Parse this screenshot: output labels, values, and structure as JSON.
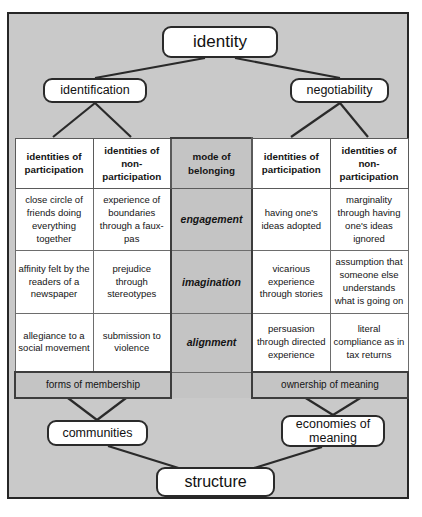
{
  "diagram": {
    "type": "hierarchy-matrix",
    "root_node": "identity",
    "left_branch": "identification",
    "right_branch": "negotiability",
    "left_band": "forms of membership",
    "right_band": "ownership of meaning",
    "left_outcome": "communities",
    "right_outcome": "economies of meaning",
    "bottom_node": "structure"
  },
  "nodes": {
    "identity": "identity",
    "identification": "identification",
    "negotiability": "negotiability",
    "communities": "communities",
    "economies_of_meaning": "economies of meaning",
    "structure": "structure"
  },
  "matrix": {
    "headers": [
      "identities of participation",
      "identities of non-participation",
      "mode of belonging",
      "identities of participation",
      "identities of non-participation"
    ],
    "rows": [
      {
        "mode": "engagement",
        "cells": [
          "close circle of friends doing everything together",
          "experience of boundaries through a faux-pas",
          "having one's ideas adopted",
          "marginality through having one's ideas ignored"
        ]
      },
      {
        "mode": "imagination",
        "cells": [
          "affinity felt by the readers of a newspaper",
          "prejudice through stereotypes",
          "vicarious experience through stories",
          "assumption that someone else understands what is going on"
        ]
      },
      {
        "mode": "alignment",
        "cells": [
          "allegiance to a social movement",
          "submission to violence",
          "persuasion through directed experience",
          "literal compliance as in tax returns"
        ]
      }
    ],
    "bands": {
      "left": "forms of membership",
      "right": "ownership of meaning"
    }
  },
  "colors": {
    "canvas": "#c9c9c9",
    "middle_column": "#c4c4c4",
    "cell_background": "#ffffff",
    "border": "#2a2a2a",
    "grid_line": "#6d6d6d",
    "text": "#111111"
  }
}
